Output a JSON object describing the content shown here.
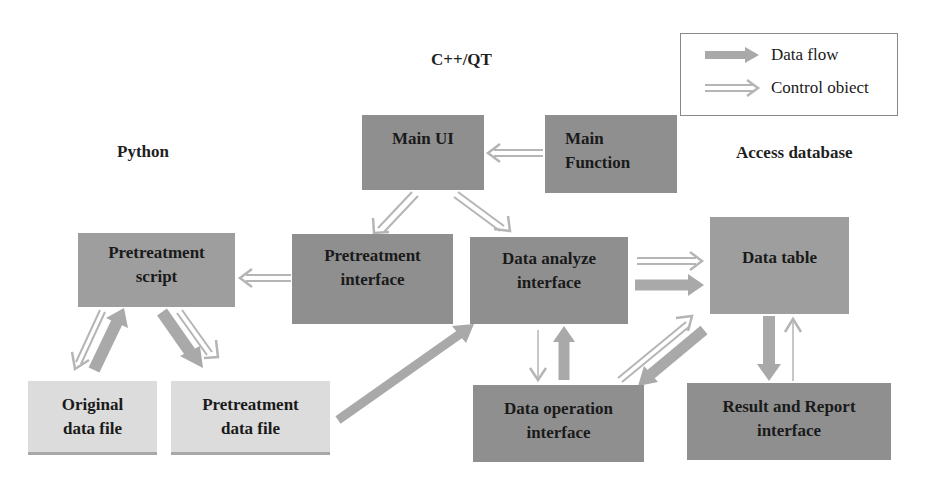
{
  "sections": {
    "cpp_qt": "C++/QT",
    "python": "Python",
    "access": "Access database"
  },
  "legend": {
    "data_flow": "Data flow",
    "control_object": "Control obiect"
  },
  "boxes": {
    "main_ui": {
      "line1": "Main UI",
      "line2": ""
    },
    "main_function": {
      "line1": "Main",
      "line2": "Function"
    },
    "pretreatment_script": {
      "line1": "Pretreatment",
      "line2": "script"
    },
    "pretreatment_interface": {
      "line1": "Pretreatment",
      "line2": "interface"
    },
    "data_analyze_interface": {
      "line1": "Data analyze",
      "line2": "interface"
    },
    "data_table": {
      "line1": "Data table",
      "line2": ""
    },
    "original_data_file": {
      "line1": "Original",
      "line2": "data file"
    },
    "pretreatment_data_file": {
      "line1": "Pretreatment",
      "line2": "data file"
    },
    "data_operation_interface": {
      "line1": "Data operation",
      "line2": "interface"
    },
    "result_report_interface": {
      "line1": "Result and Report",
      "line2": "interface"
    }
  },
  "colors": {
    "box_dark": "#8f8f8f",
    "box_mid": "#9e9e9e",
    "box_light": "#dcdcdc",
    "data_flow_arrow": "#a9a9a9",
    "control_arrow": "#b5b5b5"
  }
}
